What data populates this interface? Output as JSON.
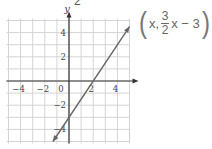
{
  "header_fragment": "2",
  "formula": {
    "open_paren": "(",
    "x_term": "x,",
    "numerator": "3",
    "denominator": "2",
    "rest": "x − 3",
    "close_paren": ")"
  },
  "colors": {
    "grid": "#d4d4d4",
    "axis": "#333333",
    "line": "#666666",
    "text": "#444444"
  },
  "chart_data": {
    "type": "line",
    "title": "",
    "equation": "y = (3/2)x - 3",
    "xlabel": "x",
    "ylabel": "y",
    "xlim": [
      -5,
      5
    ],
    "ylim": [
      -5,
      5
    ],
    "x_ticks": [
      -4,
      -2,
      0,
      2,
      4
    ],
    "y_ticks": [
      4,
      2,
      -2,
      -4
    ],
    "grid": true,
    "series": [
      {
        "name": "y = 3/2 x - 3",
        "x": [
          -1.33,
          5
        ],
        "y": [
          -5,
          4.5
        ]
      }
    ],
    "x_intercept": 2,
    "y_intercept": -3,
    "tick_labels": {
      "x": [
        "−4",
        "−2",
        "0",
        "2",
        "4"
      ],
      "y": [
        "4",
        "2",
        "−2",
        "−4"
      ]
    }
  }
}
